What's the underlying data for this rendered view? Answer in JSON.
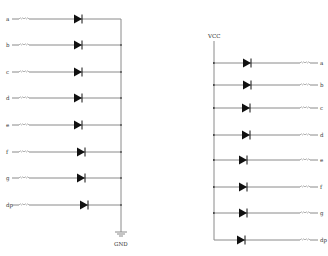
{
  "diagram": {
    "type": "seven-segment LED driver schematics",
    "left_circuit": {
      "name": "common-cathode",
      "bus_label": "GND",
      "bus_x": 121,
      "rows": [
        {
          "label": "a",
          "y": 19,
          "diode_x": 74
        },
        {
          "label": "b",
          "y": 45,
          "diode_x": 74
        },
        {
          "label": "c",
          "y": 72,
          "diode_x": 74
        },
        {
          "label": "d",
          "y": 98,
          "diode_x": 74
        },
        {
          "label": "e",
          "y": 125,
          "diode_x": 74
        },
        {
          "label": "f",
          "y": 152,
          "diode_x": 77
        },
        {
          "label": "g",
          "y": 178,
          "diode_x": 77
        },
        {
          "label": "dp",
          "y": 205,
          "diode_x": 80
        }
      ]
    },
    "right_circuit": {
      "name": "common-anode",
      "bus_label": "VCC",
      "bus_x": 214,
      "rows": [
        {
          "label": "a",
          "y": 63,
          "diode_x": 243
        },
        {
          "label": "b",
          "y": 85,
          "diode_x": 243
        },
        {
          "label": "c",
          "y": 108,
          "diode_x": 242
        },
        {
          "label": "d",
          "y": 135,
          "diode_x": 242
        },
        {
          "label": "e",
          "y": 160,
          "diode_x": 239
        },
        {
          "label": "f",
          "y": 187,
          "diode_x": 239
        },
        {
          "label": "g",
          "y": 213,
          "diode_x": 239
        },
        {
          "label": "dp",
          "y": 240,
          "diode_x": 237
        }
      ]
    },
    "colors": {
      "wire": "#8a8a8a",
      "diode": "#111111",
      "text": "#333333",
      "background": "#ffffff"
    }
  }
}
